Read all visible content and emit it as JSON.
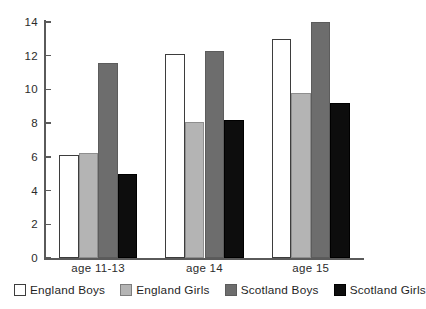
{
  "chart_data": {
    "type": "bar",
    "title": "",
    "subtitle": "",
    "xlabel": "",
    "ylabel": "",
    "categories": [
      "age 11-13",
      "age 14",
      "age 15"
    ],
    "series": [
      {
        "name": "England Boys",
        "color": "#ffffff",
        "values": [
          6.1,
          12.1,
          13.0
        ]
      },
      {
        "name": "England Girls",
        "color": "#b4b4b4",
        "values": [
          6.2,
          8.05,
          9.8
        ]
      },
      {
        "name": "Scotland Boys",
        "color": "#6d6d6d",
        "values": [
          11.55,
          12.3,
          14.0
        ]
      },
      {
        "name": "Scotland Girls",
        "color": "#0d0d0d",
        "values": [
          5.0,
          8.2,
          9.2
        ]
      }
    ],
    "ylim": [
      0,
      14
    ],
    "ytick_labels": [
      "0",
      "2",
      "4",
      "6",
      "8",
      "10",
      "12",
      "14"
    ],
    "ytick_values": [
      0,
      2,
      4,
      6,
      8,
      10,
      12,
      14
    ],
    "grid": false,
    "legend_position": "bottom",
    "legend_entries": [
      "England Boys",
      "England Girls",
      "Scotland Boys",
      "Scotland Girls"
    ]
  }
}
